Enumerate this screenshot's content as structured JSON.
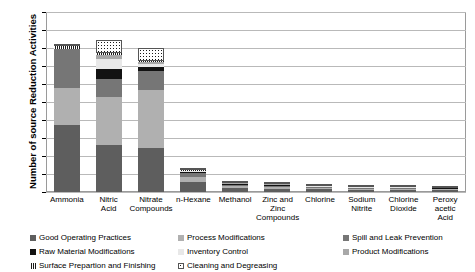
{
  "chart_data": {
    "type": "bar",
    "stacked": true,
    "title": "",
    "xlabel": "",
    "ylabel": "Number of source Reduction Activities",
    "ylim": [
      0,
      1000
    ],
    "ytick_values": [
      0,
      100,
      200,
      300,
      400,
      500,
      600,
      700,
      800,
      900,
      1000
    ],
    "ytick_labels": [
      "0",
      "100",
      "200",
      "300",
      "400",
      "500",
      "600",
      "700",
      "800",
      "900",
      "1,000"
    ],
    "grid": true,
    "legend_position": "bottom",
    "categories": [
      "Ammonia",
      "Nitric Acid",
      "Nitrate Compounds",
      "n-Hexane",
      "Methanol",
      "Zinc and Zinc Compounds",
      "Chlorine",
      "Sodium Nitrite",
      "Chlorine Dioxide",
      "Peroxy acetic Acid"
    ],
    "category_lines": [
      [
        "Ammonia"
      ],
      [
        "Nitric",
        "Acid"
      ],
      [
        "Nitrate",
        "Compounds"
      ],
      [
        "n-Hexane"
      ],
      [
        "Methanol"
      ],
      [
        "Zinc and",
        "Zinc Compounds"
      ],
      [
        "Chlorine"
      ],
      [
        "Sodium",
        "Nitrite"
      ],
      [
        "Chlorine",
        "Dioxide"
      ],
      [
        "Peroxy",
        "acetic",
        "Acid"
      ]
    ],
    "series": [
      {
        "name": "Good Operating Practices",
        "color": "#5e5e5e",
        "values": [
          370,
          260,
          245,
          55,
          20,
          18,
          14,
          12,
          12,
          10
        ]
      },
      {
        "name": "Process Modifications",
        "color": "#b0b0b0",
        "values": [
          210,
          270,
          320,
          30,
          12,
          10,
          8,
          6,
          6,
          5
        ]
      },
      {
        "name": "Spill and Leak Prevention",
        "color": "#767676",
        "values": [
          215,
          100,
          110,
          20,
          8,
          6,
          5,
          4,
          4,
          4
        ]
      },
      {
        "name": "Raw Material Modifications",
        "color": "#121212",
        "values": [
          0,
          55,
          20,
          5,
          4,
          3,
          3,
          2,
          2,
          2
        ]
      },
      {
        "name": "Inventory Control",
        "color": "#e8e8e8",
        "values": [
          0,
          55,
          15,
          5,
          3,
          3,
          2,
          2,
          2,
          2
        ]
      },
      {
        "name": "Product Modifications",
        "color": "#a8a8a8",
        "values": [
          0,
          20,
          10,
          4,
          3,
          2,
          2,
          2,
          2,
          1
        ]
      },
      {
        "name": "Surface Prepartion and Finishing",
        "color": "#1b1b1b",
        "values": [
          15,
          10,
          10,
          3,
          2,
          2,
          2,
          1,
          1,
          1
        ]
      },
      {
        "name": "Cleaning and Degreasing",
        "color": "#ffffff",
        "values": [
          10,
          75,
          70,
          3,
          8,
          8,
          5,
          6,
          3,
          4
        ]
      }
    ],
    "totals": [
      820,
      845,
      800,
      125,
      60,
      52,
      41,
      35,
      32,
      29
    ]
  },
  "legend": {
    "rows": [
      [
        {
          "label": "Good Operating Practices",
          "series": 0
        },
        {
          "label": "Process Modifications",
          "series": 1
        },
        {
          "label": "Spill and Leak Prevention",
          "series": 2
        }
      ],
      [
        {
          "label": "Raw Material Modifications",
          "series": 3
        },
        {
          "label": "Inventory Control",
          "series": 4
        },
        {
          "label": "Product Modifications",
          "series": 5
        }
      ],
      [
        {
          "label": "Surface Prepartion and Finishing",
          "series": 6
        },
        {
          "label": "Cleaning and Degreasing",
          "series": 7
        }
      ]
    ]
  }
}
